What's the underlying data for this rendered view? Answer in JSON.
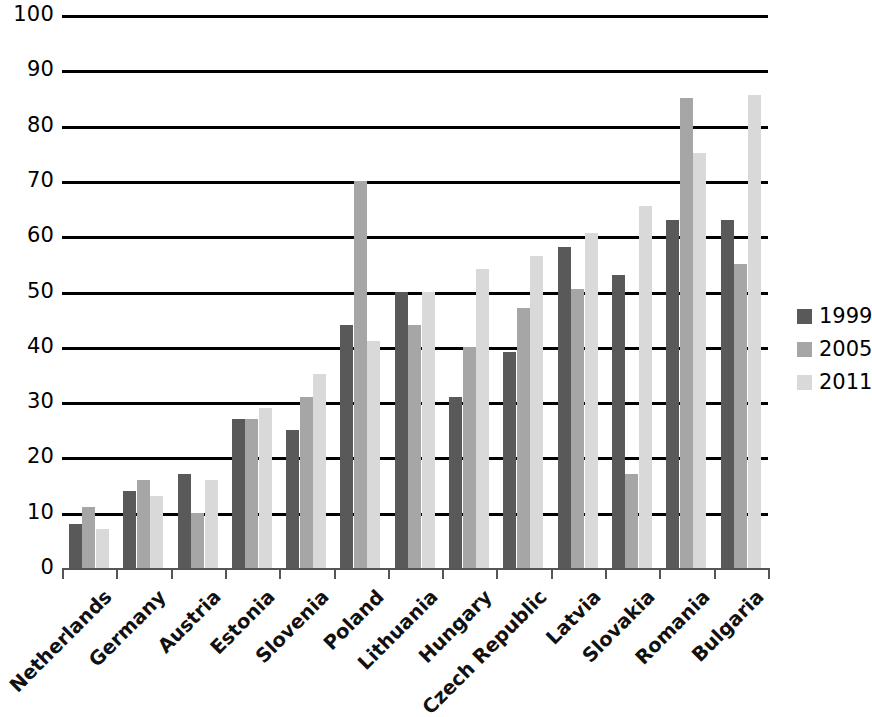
{
  "chart_data": {
    "type": "bar",
    "title": "",
    "subtitle": "",
    "xlabel": "",
    "ylabel": "",
    "ylim": [
      0,
      100
    ],
    "ytick_step": 10,
    "yticks": [
      100,
      90,
      80,
      70,
      60,
      50,
      40,
      30,
      20,
      10,
      0
    ],
    "grid": true,
    "grid_axis": "y",
    "legend_position": "right",
    "categories": [
      "Netherlands",
      "Germany",
      "Austria",
      "Estonia",
      "Slovenia",
      "Poland",
      "Lithuania",
      "Hungary",
      "Czech Republic",
      "Latvia",
      "Slovakia",
      "Romania",
      "Bulgaria"
    ],
    "series": [
      {
        "name": "1999",
        "color": "#595959",
        "values": [
          8,
          14,
          17,
          27,
          25,
          44,
          50,
          31,
          39,
          58,
          53,
          63,
          63
        ]
      },
      {
        "name": "2005",
        "color": "#a6a6a6",
        "values": [
          11,
          16,
          10,
          27,
          31,
          70,
          44,
          40,
          47,
          50.5,
          17,
          85,
          55
        ]
      },
      {
        "name": "2011",
        "color": "#d9d9d9",
        "values": [
          7,
          13,
          16,
          29,
          35,
          41,
          50,
          54,
          56.5,
          60.5,
          65.5,
          75,
          85.5
        ]
      }
    ]
  },
  "legend": {
    "items": [
      {
        "label": "1999",
        "color": "#595959"
      },
      {
        "label": "2005",
        "color": "#a6a6a6"
      },
      {
        "label": "2011",
        "color": "#d9d9d9"
      }
    ]
  },
  "axes": {
    "gridline_color": "#000000",
    "axis_color": "#555555"
  }
}
